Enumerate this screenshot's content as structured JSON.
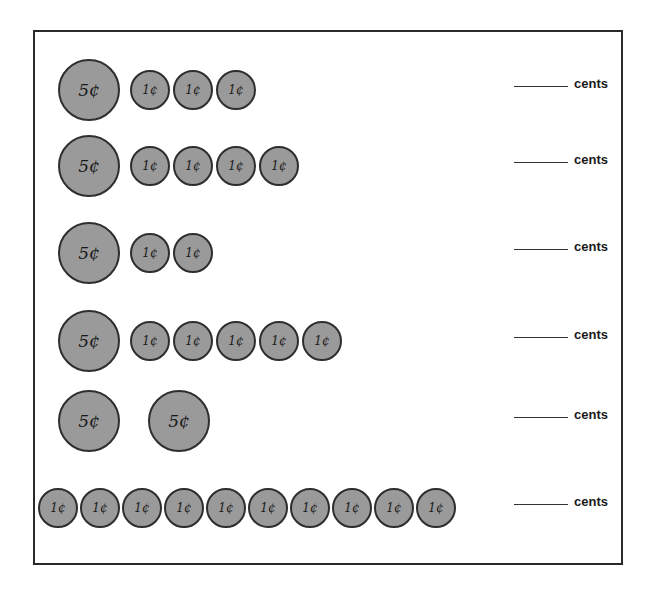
{
  "worksheet": {
    "unit_label": "cents",
    "coin_labels": {
      "nickel": "5¢",
      "penny": "1¢"
    },
    "colors": {
      "coin_fill": "#9a9a9a",
      "coin_stroke": "#2e2e2e",
      "border": "#2a2a2a"
    },
    "rows": [
      {
        "coins": [
          "nickel",
          "penny",
          "penny",
          "penny"
        ],
        "answer": "",
        "unit": "cents"
      },
      {
        "coins": [
          "nickel",
          "penny",
          "penny",
          "penny",
          "penny"
        ],
        "answer": "",
        "unit": "cents"
      },
      {
        "coins": [
          "nickel",
          "penny",
          "penny"
        ],
        "answer": "",
        "unit": "cents"
      },
      {
        "coins": [
          "nickel",
          "penny",
          "penny",
          "penny",
          "penny",
          "penny"
        ],
        "answer": "",
        "unit": "cents"
      },
      {
        "coins": [
          "nickel",
          "nickel"
        ],
        "answer": "",
        "unit": "cents"
      },
      {
        "coins": [
          "penny",
          "penny",
          "penny",
          "penny",
          "penny",
          "penny",
          "penny",
          "penny",
          "penny",
          "penny"
        ],
        "answer": "",
        "unit": "cents"
      }
    ]
  }
}
